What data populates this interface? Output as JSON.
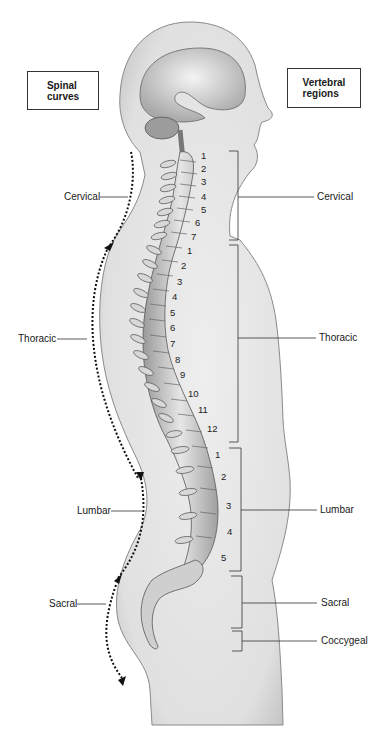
{
  "title_left": {
    "line1": "Spinal",
    "line2": "curves"
  },
  "title_right": {
    "line1": "Vertebral",
    "line2": "regions"
  },
  "spinal_curves": [
    "Cervical",
    "Thoracic",
    "Lumbar",
    "Sacral"
  ],
  "vertebral_regions": [
    "Cervical",
    "Thoracic",
    "Lumbar",
    "Sacral",
    "Coccygeal"
  ],
  "cervical_numbers": [
    "1",
    "2",
    "3",
    "4",
    "5",
    "6",
    "7"
  ],
  "thoracic_numbers": [
    "1",
    "2",
    "3",
    "4",
    "5",
    "6",
    "7",
    "8",
    "9",
    "10",
    "11",
    "12"
  ],
  "lumbar_numbers": [
    "1",
    "2",
    "3",
    "4",
    "5"
  ],
  "colors": {
    "body_fill": "#e4e4e4",
    "body_edge": "#9a9a9a",
    "bone": "#cfcfcf",
    "line": "#333333"
  }
}
